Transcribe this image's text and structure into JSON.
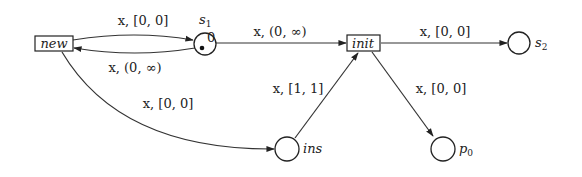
{
  "diagram": {
    "type": "timed-arc petri net",
    "transitions": [
      {
        "id": "new",
        "label": "new"
      },
      {
        "id": "init",
        "label": "init"
      }
    ],
    "places": [
      {
        "id": "s1",
        "label": "s",
        "sub": "1",
        "tokens": 1,
        "token_age": "0"
      },
      {
        "id": "s2",
        "label": "s",
        "sub": "2"
      },
      {
        "id": "ins",
        "label": "ins",
        "sub": ""
      },
      {
        "id": "p0",
        "label": "p",
        "sub": "0"
      }
    ],
    "arcs": [
      {
        "from": "new",
        "to": "s1",
        "var": "x",
        "interval": "[0, 0]"
      },
      {
        "from": "s1",
        "to": "new",
        "var": "x",
        "interval": "(0, ∞)"
      },
      {
        "from": "s1",
        "to": "init",
        "var": "x",
        "interval": "(0, ∞)"
      },
      {
        "from": "init",
        "to": "s2",
        "var": "x",
        "interval": "[0, 0]"
      },
      {
        "from": "new",
        "to": "ins",
        "var": "x",
        "interval": "[0, 0]"
      },
      {
        "from": "ins",
        "to": "init",
        "var": "x",
        "interval": "[1, 1]"
      },
      {
        "from": "init",
        "to": "p0",
        "var": "x",
        "interval": "[0, 0]"
      }
    ]
  },
  "arc_labels": {
    "new_s1": "x, [0, 0]",
    "s1_new": "x, (0, ∞)",
    "s1_init": "x, (0, ∞)",
    "init_s2": "x, [0, 0]",
    "new_ins": "x, [0, 0]",
    "ins_init": "x, [1, 1]",
    "init_p0": "x, [0, 0]"
  }
}
